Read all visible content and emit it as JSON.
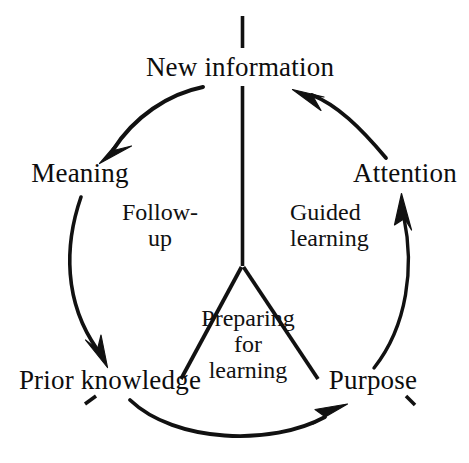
{
  "diagram": {
    "type": "cycle-diagram",
    "stroke_color": "#111111",
    "background_color": "#ffffff",
    "nodes": [
      {
        "id": "new-information",
        "label": "New information",
        "position": "top"
      },
      {
        "id": "meaning",
        "label": "Meaning",
        "position": "upper-left"
      },
      {
        "id": "attention",
        "label": "Attention",
        "position": "upper-right"
      },
      {
        "id": "prior-knowledge",
        "label": "Prior knowledge",
        "position": "lower-left"
      },
      {
        "id": "purpose",
        "label": "Purpose",
        "position": "lower-right"
      }
    ],
    "sectors": [
      {
        "id": "follow-up",
        "lines": [
          "Follow-",
          "up"
        ],
        "line1": "Follow-",
        "line2": "up",
        "position": "left"
      },
      {
        "id": "guided-learning",
        "lines": [
          "Guided",
          "learning"
        ],
        "line1": "Guided",
        "line2": "learning",
        "position": "right"
      },
      {
        "id": "preparing-for-learning",
        "lines": [
          "Preparing",
          "for",
          "learning"
        ],
        "line1": "Preparing",
        "line2": "for",
        "line3": "learning",
        "position": "bottom"
      }
    ],
    "arrows": [
      {
        "id": "arrow-new-information-to-meaning",
        "from": "new-information",
        "to": "meaning"
      },
      {
        "id": "arrow-meaning-to-prior-knowledge",
        "from": "meaning",
        "to": "prior-knowledge"
      },
      {
        "id": "arrow-prior-knowledge-to-purpose",
        "from": "prior-knowledge",
        "to": "purpose"
      },
      {
        "id": "arrow-purpose-to-attention",
        "from": "purpose",
        "to": "attention"
      },
      {
        "id": "arrow-attention-to-new-information",
        "from": "attention",
        "to": "new-information"
      }
    ],
    "spokes": [
      {
        "id": "spoke-top",
        "from": "hub",
        "to": "new-information"
      },
      {
        "id": "spoke-lower-left",
        "from": "hub",
        "to": "prior-knowledge"
      },
      {
        "id": "spoke-lower-right",
        "from": "hub",
        "to": "purpose"
      }
    ]
  }
}
